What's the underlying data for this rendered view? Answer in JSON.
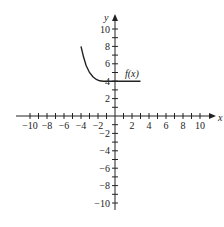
{
  "chart_data": {
    "type": "line",
    "title": "",
    "xlabel": "x",
    "ylabel": "y",
    "xlim": [
      -10,
      10
    ],
    "ylim": [
      -10,
      10
    ],
    "grid": false,
    "x_tick_labels": [
      "-10",
      "-8",
      "-6",
      "-4",
      "-2",
      "2",
      "4",
      "6",
      "8",
      "10"
    ],
    "y_tick_labels": [
      "10",
      "8",
      "6",
      "4",
      "2",
      "-2",
      "-4",
      "-6",
      "-8",
      "-10"
    ],
    "series": [
      {
        "name": "f(x)",
        "description": "Decaying curve from (-4, 8) approaching y = 4 near x = -2, then horizontal at y = 4 to x = 3",
        "points": [
          {
            "x": -4.0,
            "y": 8.0
          },
          {
            "x": -3.7,
            "y": 6.8
          },
          {
            "x": -3.4,
            "y": 5.8
          },
          {
            "x": -3.0,
            "y": 5.0
          },
          {
            "x": -2.6,
            "y": 4.5
          },
          {
            "x": -2.2,
            "y": 4.2
          },
          {
            "x": -1.8,
            "y": 4.05
          },
          {
            "x": -1.4,
            "y": 4.0
          },
          {
            "x": 0.0,
            "y": 4.0
          },
          {
            "x": 3.0,
            "y": 4.0
          }
        ]
      }
    ],
    "annotations": [
      {
        "text": "f(x)",
        "x": 1.5,
        "y": 5
      }
    ]
  },
  "labels": {
    "x_axis": "x",
    "y_axis": "y",
    "function": "f(x)"
  }
}
